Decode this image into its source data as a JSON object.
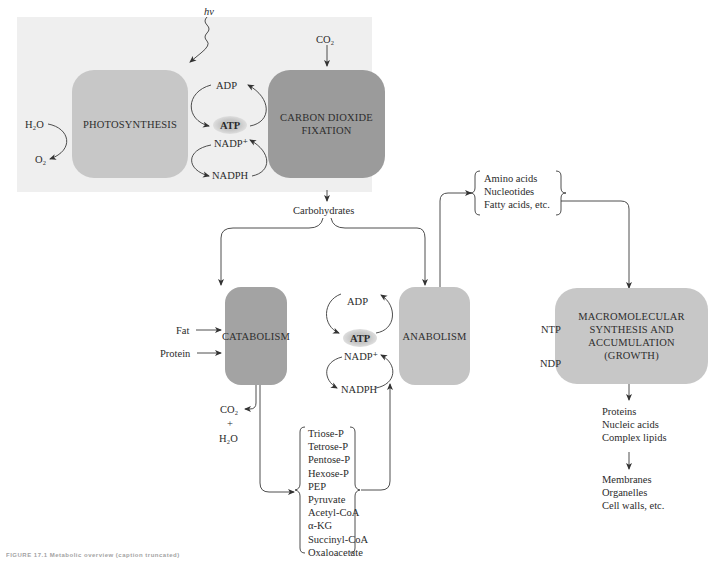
{
  "panel": {
    "light_label": "hν",
    "co2_in": "CO₂",
    "h2o": "H₂O",
    "o2": "O₂",
    "photosynthesis": "PHOTOSYNTHESIS",
    "co2_fixation_line1": "CARBON DIOXIDE",
    "co2_fixation_line2": "FIXATION",
    "adp": "ADP",
    "atp": "ATP",
    "nadp": "NADP⁺",
    "nadph": "NADPH"
  },
  "carbohydrates": "Carbohydrates",
  "catabolism": {
    "label": "CATABOLISM",
    "inputs": [
      "Fat",
      "Protein"
    ],
    "co2": "CO₂",
    "plus": "+",
    "h2o": "H₂O"
  },
  "anabolism": {
    "label": "ANABOLISM"
  },
  "cofactors": {
    "adp": "ADP",
    "atp": "ATP",
    "nadp": "NADP⁺",
    "nadph": "NADPH"
  },
  "intermediates": [
    "Triose-P",
    "Tetrose-P",
    "Pentose-P",
    "Hexose-P",
    "PEP",
    "Pyruvate",
    "Acetyl-CoA",
    "α-KG",
    "Succinyl-CoA",
    "Oxaloacetate"
  ],
  "building_blocks": [
    "Amino acids",
    "Nucleotides",
    "Fatty acids, etc."
  ],
  "macromolecular": {
    "lines": [
      "MACROMOLECULAR",
      "SYNTHESIS AND",
      "ACCUMULATION",
      "(GROWTH)"
    ],
    "ntp": "NTP",
    "ndp": "NDP"
  },
  "macromolecules": [
    "Proteins",
    "Nucleic acids",
    "Complex lipids"
  ],
  "structures": [
    "Membranes",
    "Organelles",
    "Cell walls, etc."
  ],
  "caption": "FIGURE 17.1 Metabolic overview (caption truncated)",
  "colors": {
    "panel_bg": "#efefef",
    "photosynthesis_box": "#c7c7c7",
    "co2_fixation_box": "#9b9b9b",
    "catabolism_box": "#a3a3a3",
    "anabolism_box": "#c4c4c4",
    "macromolecular_box": "#c7c7c7"
  }
}
